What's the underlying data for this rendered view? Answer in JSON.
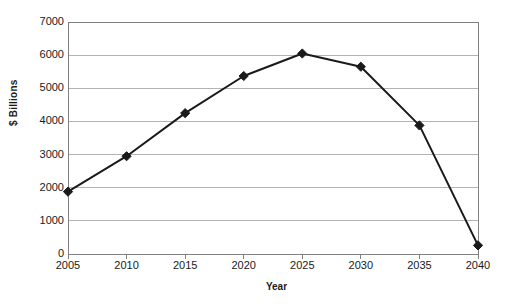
{
  "chart_data": {
    "type": "line",
    "title": "",
    "xlabel": "Year",
    "ylabel": "$ Billions",
    "x": [
      2005,
      2010,
      2015,
      2020,
      2025,
      2030,
      2035,
      2040
    ],
    "categories": [
      "2005",
      "2010",
      "2015",
      "2020",
      "2025",
      "2030",
      "2035",
      "2040"
    ],
    "values": [
      1880,
      2950,
      4250,
      5370,
      6050,
      5650,
      3880,
      260
    ],
    "series": [
      {
        "name": "$ Billions",
        "values": [
          1880,
          2950,
          4250,
          5370,
          6050,
          5650,
          3880,
          260
        ]
      }
    ],
    "xlim": [
      2005,
      2040
    ],
    "ylim": [
      0,
      7000
    ],
    "ytick_labels": [
      "0",
      "1000",
      "2000",
      "3000",
      "4000",
      "5000",
      "6000",
      "7000"
    ],
    "ytick_values": [
      0,
      1000,
      2000,
      3000,
      4000,
      5000,
      6000,
      7000
    ],
    "grid": "horizontal",
    "legend": "none",
    "marker": "diamond",
    "line_color": "#1a1a1a",
    "marker_color": "#1a1a1a",
    "grid_color": "#b3b3b3",
    "axis_color": "#808080",
    "background_color": "#ffffff"
  },
  "axes": {
    "x_title": "Year",
    "y_title": "$ Billions"
  }
}
